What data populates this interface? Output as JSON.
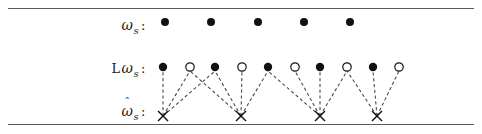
{
  "figure": {
    "title": "",
    "rows": [
      {
        "id": "omega-s",
        "label_prefix": "",
        "label_symbol": "ω",
        "label_subscript": "s",
        "label_colon": ":",
        "has_hat": false,
        "y": 22
      },
      {
        "id": "l-omega-s",
        "label_prefix": "L",
        "label_symbol": "ω",
        "label_subscript": "s",
        "label_colon": ":",
        "has_hat": false,
        "y": 67
      },
      {
        "id": "omega-hat-s",
        "label_prefix": "",
        "label_symbol": "ω",
        "label_subscript": "s",
        "label_colon": ":",
        "has_hat": true,
        "hat_glyph": "ˆ",
        "y": 116
      }
    ],
    "colors": {
      "ink": "#111111",
      "rule": "#5a5a5a",
      "dash": "#4a4a4a",
      "background": "#ffffff"
    }
  },
  "chart_data": {
    "type": "scatter",
    "title": "",
    "xlabel": "",
    "ylabel": "",
    "grid": false,
    "legend": "none",
    "xlim": [
      150,
      400
    ],
    "ylim": [
      0,
      134
    ],
    "series": [
      {
        "name": "ω_s",
        "marker": "filled-circle",
        "row_y": 22,
        "radius": 4,
        "points": [
          {
            "x": 165,
            "y": 22
          },
          {
            "x": 211,
            "y": 22
          },
          {
            "x": 258,
            "y": 22
          },
          {
            "x": 304,
            "y": 22
          },
          {
            "x": 350,
            "y": 22
          }
        ]
      },
      {
        "name": "L ω_s",
        "row_y": 67,
        "radius": 4.2,
        "points": [
          {
            "x": 163,
            "y": 67,
            "marker": "filled-circle"
          },
          {
            "x": 190,
            "y": 67,
            "marker": "open-circle"
          },
          {
            "x": 215,
            "y": 67,
            "marker": "filled-circle"
          },
          {
            "x": 242,
            "y": 67,
            "marker": "open-circle"
          },
          {
            "x": 268,
            "y": 67,
            "marker": "filled-circle"
          },
          {
            "x": 295,
            "y": 67,
            "marker": "open-circle"
          },
          {
            "x": 320,
            "y": 67,
            "marker": "filled-circle"
          },
          {
            "x": 347,
            "y": 67,
            "marker": "open-circle"
          },
          {
            "x": 373,
            "y": 67,
            "marker": "filled-circle"
          },
          {
            "x": 399,
            "y": 67,
            "marker": "open-circle"
          }
        ]
      },
      {
        "name": "ω̂_s",
        "marker": "x",
        "row_y": 116,
        "size": 5,
        "points": [
          {
            "x": 163,
            "y": 116
          },
          {
            "x": 241,
            "y": 116
          },
          {
            "x": 320,
            "y": 116
          },
          {
            "x": 377,
            "y": 116
          }
        ]
      }
    ],
    "links": [
      {
        "from": [
          163,
          116
        ],
        "to": [
          163,
          71
        ],
        "style": "dashed"
      },
      {
        "from": [
          163,
          116
        ],
        "to": [
          190,
          71
        ],
        "style": "dashed"
      },
      {
        "from": [
          163,
          116
        ],
        "to": [
          215,
          71
        ],
        "style": "dashed"
      },
      {
        "from": [
          241,
          116
        ],
        "to": [
          190,
          71
        ],
        "style": "dashed"
      },
      {
        "from": [
          241,
          116
        ],
        "to": [
          215,
          71
        ],
        "style": "dashed"
      },
      {
        "from": [
          241,
          116
        ],
        "to": [
          242,
          71
        ],
        "style": "dashed"
      },
      {
        "from": [
          241,
          116
        ],
        "to": [
          268,
          71
        ],
        "style": "dashed"
      },
      {
        "from": [
          320,
          116
        ],
        "to": [
          268,
          71
        ],
        "style": "dashed"
      },
      {
        "from": [
          320,
          116
        ],
        "to": [
          295,
          71
        ],
        "style": "dashed"
      },
      {
        "from": [
          320,
          116
        ],
        "to": [
          320,
          71
        ],
        "style": "dashed"
      },
      {
        "from": [
          320,
          116
        ],
        "to": [
          347,
          71
        ],
        "style": "dashed"
      },
      {
        "from": [
          377,
          116
        ],
        "to": [
          347,
          71
        ],
        "style": "dashed"
      },
      {
        "from": [
          377,
          116
        ],
        "to": [
          373,
          71
        ],
        "style": "dashed"
      },
      {
        "from": [
          377,
          116
        ],
        "to": [
          399,
          71
        ],
        "style": "dashed"
      }
    ]
  }
}
